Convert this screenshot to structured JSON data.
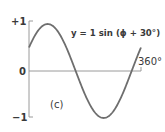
{
  "chart_data": {
    "type": "line",
    "title": "",
    "equation_label": "y = 1 sin (ϕ + 30°)",
    "panel_label": "(c)",
    "xlabel": "ϕ",
    "ylabel": "y",
    "x_range_deg": [
      0,
      360
    ],
    "ylim": [
      -1,
      1
    ],
    "y_ticks": [
      "+1",
      "0",
      "−1"
    ],
    "x_tick_labels": [
      "360°"
    ],
    "amplitude": 1,
    "phase_shift_deg": 30,
    "series": [
      {
        "name": "y = 1 sin (ϕ + 30°)",
        "x": [
          0,
          30,
          60,
          90,
          120,
          150,
          180,
          210,
          240,
          270,
          300,
          330,
          360
        ],
        "values": [
          0.5,
          0.866,
          1.0,
          0.866,
          0.5,
          0.0,
          -0.5,
          -0.866,
          -1.0,
          -0.866,
          -0.5,
          0.0,
          0.5
        ]
      }
    ],
    "grid": false,
    "legend": "none"
  },
  "labels": {
    "y_top": "+1",
    "y_zero": "0",
    "y_bottom": "−1",
    "x_end": "360°",
    "equation": "y = 1 sin (ϕ + 30°)",
    "panel": "(c)"
  },
  "colors": {
    "curve": "#6e6e6e",
    "axis": "#9a9a9a",
    "text": "#3a3a3a"
  }
}
